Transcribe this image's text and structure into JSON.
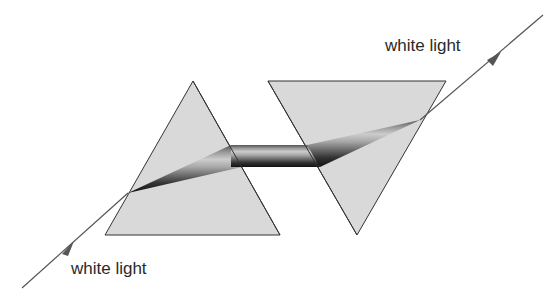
{
  "diagram": {
    "labels": {
      "input": "white light",
      "output": "white light"
    },
    "elements": {
      "prism_left": {
        "orientation": "apex-up",
        "points": [
          [
            193,
            81
          ],
          [
            105,
            235
          ],
          [
            280,
            235
          ]
        ]
      },
      "prism_right": {
        "orientation": "apex-down",
        "points": [
          [
            268,
            81
          ],
          [
            446,
            81
          ],
          [
            357,
            235
          ]
        ]
      },
      "ray_in": {
        "from": [
          22,
          288
        ],
        "to": [
          128,
          193
        ]
      },
      "ray_out": {
        "from": [
          423,
          120
        ],
        "to": [
          543,
          15
        ]
      }
    },
    "colors": {
      "prism_fill": "#d9d9d9",
      "outline": "#333333",
      "ray": "#555555"
    }
  }
}
